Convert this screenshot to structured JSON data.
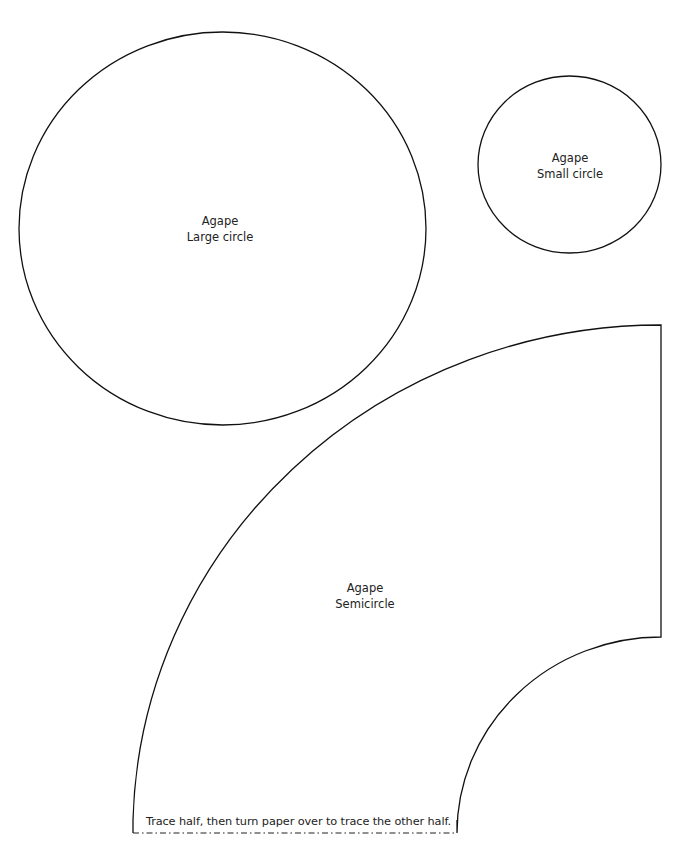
{
  "page": {
    "background": "#ffffff",
    "stroke_color": "#111111"
  },
  "templates": {
    "large_circle": {
      "brand": "Agape",
      "name": "Large circle"
    },
    "small_circle": {
      "brand": "Agape",
      "name": "Small circle"
    },
    "semicircle": {
      "brand": "Agape",
      "name": "Semicircle",
      "instruction": "Trace half, then turn paper over to trace the other half."
    }
  }
}
